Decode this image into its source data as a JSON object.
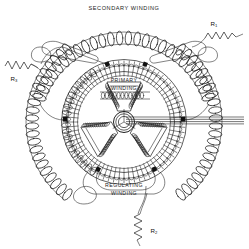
{
  "figure": {
    "kind": "electrical-schematic",
    "background_color": "#ffffff",
    "ink_color": "#1b1b1b"
  },
  "labels": {
    "secondary_winding": "SECONDARY  WINDING",
    "primary_winding_line1": "PRIMARY",
    "primary_winding_line2": "WINDING",
    "regulating_winding_line1": "REGULATING",
    "regulating_winding_line2": "WINDING"
  },
  "resistors": [
    {
      "id": "r1",
      "label": "R",
      "subscript": "1",
      "position": "top-right",
      "x": 214,
      "y": 22
    },
    {
      "id": "r2",
      "label": "R",
      "subscript": "2",
      "position": "bottom-center",
      "x": 159,
      "y": 232
    },
    {
      "id": "r3",
      "label": "R",
      "subscript": "3",
      "position": "left",
      "x": 13,
      "y": 80
    }
  ],
  "windings": [
    {
      "name": "secondary-winding",
      "location": "outer-arcs",
      "turns_per_arc": 26
    },
    {
      "name": "primary-winding",
      "location": "rotor-center",
      "turns_per_arc": 12
    },
    {
      "name": "regulating-winding",
      "location": "bottom-arc",
      "turns_per_arc": 20
    }
  ],
  "stator": {
    "slot_count": 72,
    "outer_radius": 62,
    "inner_radius": 50,
    "center_x": 124,
    "center_y": 122
  },
  "rotor": {
    "shape": "three-arm-Y-core",
    "hub_radius": 9,
    "center_x": 124,
    "center_y": 122
  },
  "terminals": {
    "count": 6,
    "note": "black square taps on stator ring"
  },
  "shaft_leads": {
    "count": 4,
    "direction": "right",
    "y_positions": [
      117,
      119,
      121,
      123
    ]
  }
}
